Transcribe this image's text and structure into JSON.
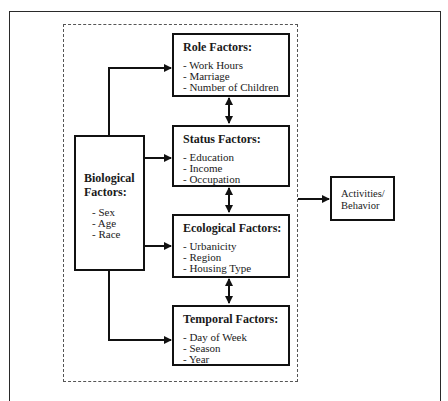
{
  "diagram": {
    "biological": {
      "title": "Biological Factors:",
      "items": [
        "Sex",
        "Age",
        "Race"
      ]
    },
    "factors": [
      {
        "id": "role",
        "title": "Role Factors:",
        "items": [
          "Work Hours",
          "Marriage",
          "Number of Children"
        ]
      },
      {
        "id": "status",
        "title": "Status Factors:",
        "items": [
          "Education",
          "Income",
          "Occupation"
        ]
      },
      {
        "id": "ecological",
        "title": "Ecological Factors:",
        "items": [
          "Urbanicity",
          "Region",
          "Housing Type"
        ]
      },
      {
        "id": "temporal",
        "title": "Temporal Factors:",
        "items": [
          "Day of Week",
          "Season",
          "Year"
        ]
      }
    ],
    "outcome": {
      "line1": "Activities/",
      "line2": "Behavior"
    },
    "colors": {
      "line": "#111111",
      "border": "#2a2a2a",
      "dashed": "#555555"
    }
  }
}
